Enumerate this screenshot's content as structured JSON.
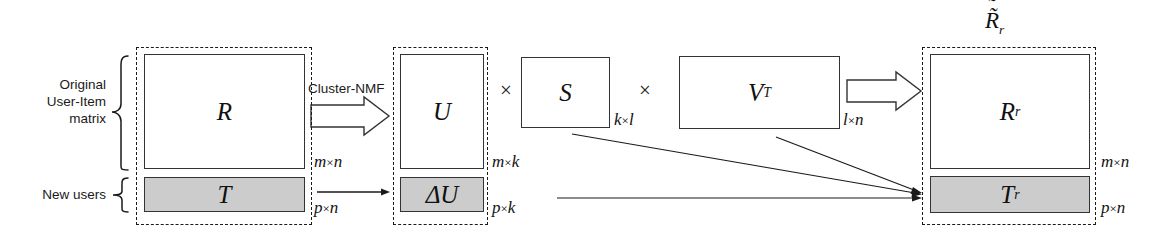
{
  "figure": {
    "type": "matrix-factorization-diagram",
    "caption_symbols": {
      "times": "×"
    },
    "left_annotations": [
      {
        "id": "original-matrix",
        "lines": [
          "Original",
          "User-Item",
          "matrix"
        ]
      },
      {
        "id": "new-users",
        "lines": [
          "New users"
        ]
      }
    ],
    "process_label": "Cluster-NMF",
    "blocks": [
      {
        "id": "input-group",
        "parts": [
          {
            "id": "R",
            "label": "R",
            "dim": "m×n",
            "shaded": false
          },
          {
            "id": "T",
            "label": "T",
            "dim": "p×n",
            "shaded": true
          }
        ]
      },
      {
        "id": "u-group",
        "parts": [
          {
            "id": "U",
            "label": "U",
            "dim": "m×k",
            "shaded": false
          },
          {
            "id": "dU",
            "label": "ΔU",
            "dim": "p×k",
            "shaded": true
          }
        ]
      },
      {
        "id": "s-group",
        "parts": [
          {
            "id": "S",
            "label": "S",
            "dim": "k×l",
            "shaded": false
          }
        ]
      },
      {
        "id": "v-group",
        "parts": [
          {
            "id": "VT",
            "label": "V",
            "sup": "T",
            "dim": "l×n",
            "shaded": false
          }
        ]
      },
      {
        "id": "output-group",
        "title": "R̃",
        "title_sub": "r",
        "parts": [
          {
            "id": "Rr",
            "label": "R",
            "sub": "r",
            "dim": "m×n",
            "shaded": false
          },
          {
            "id": "Tr",
            "label": "T",
            "sub": "r",
            "dim": "p×n",
            "shaded": true
          }
        ]
      }
    ],
    "colors": {
      "shaded_fill": "#cccccc",
      "stroke": "#333333",
      "dashed_stroke": "#1a1a1a",
      "background": "#ffffff"
    }
  }
}
